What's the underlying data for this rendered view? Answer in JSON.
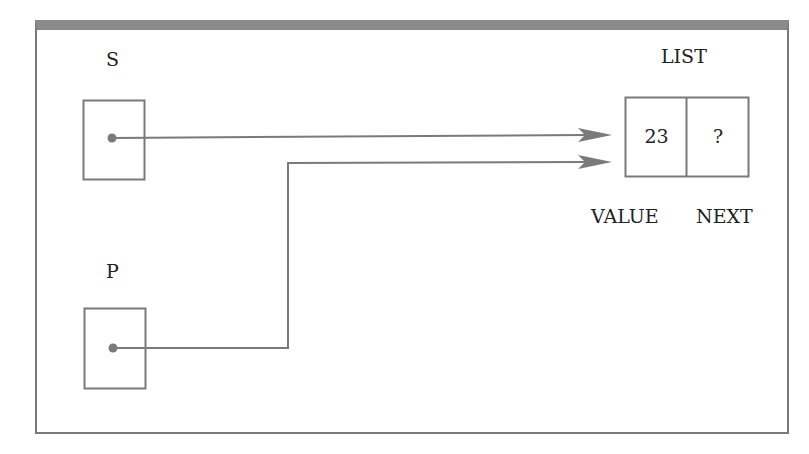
{
  "diagram": {
    "variables": [
      {
        "name": "S"
      },
      {
        "name": "P"
      }
    ],
    "node": {
      "label": "LIST",
      "value": "23",
      "next": "?",
      "field_labels": {
        "value": "VALUE",
        "next": "NEXT"
      }
    }
  },
  "colors": {
    "line": "#7a7a7a",
    "frame_top": "#8a8a8a"
  }
}
